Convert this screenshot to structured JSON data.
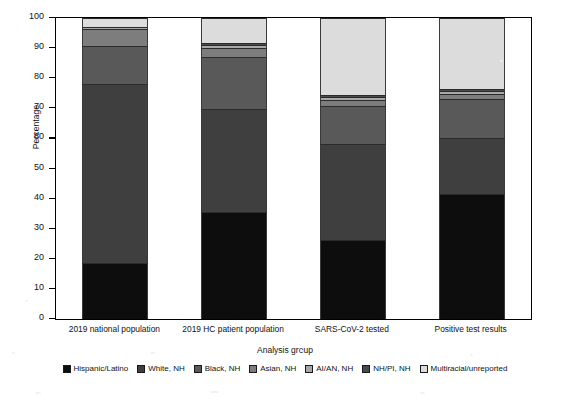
{
  "chart_data": {
    "type": "bar",
    "subtype": "stacked-100-percent",
    "title": "",
    "xlabel": "Analysis group",
    "ylabel": "Percentage",
    "ylim": [
      0,
      100
    ],
    "yticks": [
      0,
      10,
      20,
      30,
      40,
      50,
      60,
      70,
      80,
      90,
      100
    ],
    "ytick_labels": [
      "0",
      "10",
      "20",
      "30",
      "40",
      "50",
      "60",
      "70",
      "80",
      "90",
      "100"
    ],
    "grid": false,
    "legend_position": "bottom",
    "categories": [
      "2019 national population",
      "2019 HC patient population",
      "SARS-CoV-2 tested",
      "Positive test results"
    ],
    "series": [
      {
        "name": "Hispanic/Latino",
        "color": "#0d0d0d",
        "values": [
          18.7,
          35.5,
          26.1,
          41.5
        ]
      },
      {
        "name": "White, NH",
        "color": "#3f3f3f",
        "values": [
          59.4,
          34.2,
          32.2,
          18.7
        ]
      },
      {
        "name": "Black, NH",
        "color": "#595959",
        "values": [
          12.5,
          17.2,
          12.5,
          13.0
        ]
      },
      {
        "name": "Asian, NH",
        "color": "#7d7d7d",
        "values": [
          5.6,
          3.3,
          2.0,
          1.5
        ]
      },
      {
        "name": "AI/AN, NH",
        "color": "#a8a8a8",
        "values": [
          0.7,
          1.0,
          1.0,
          1.0
        ]
      },
      {
        "name": "NH/PI, NH",
        "color": "#4a4a4a",
        "values": [
          0.2,
          0.5,
          0.6,
          0.6
        ]
      },
      {
        "name": "Multiracial/unreported",
        "color": "#dcdcdc",
        "values": [
          2.9,
          8.3,
          25.6,
          23.7
        ]
      }
    ]
  },
  "axis": {
    "y_title": "Percentage",
    "x_title": "Analysis group"
  },
  "legend": {
    "items": [
      {
        "label": "Hispanic/Latino"
      },
      {
        "label": "White, NH"
      },
      {
        "label": "Black, NH"
      },
      {
        "label": "Asian, NH"
      },
      {
        "label": "AI/AN, NH"
      },
      {
        "label": "NH/PI, NH"
      },
      {
        "label": "Multiracial/unreported"
      }
    ]
  },
  "bottom_caption": ""
}
